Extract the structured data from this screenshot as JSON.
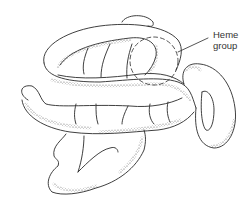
{
  "diagram": {
    "labels": {
      "heme_line1": "Heme",
      "heme_line2": "group"
    },
    "colors": {
      "stroke": "#2a2a2a",
      "stipple": "#6a6a6a",
      "background": "#ffffff"
    }
  }
}
